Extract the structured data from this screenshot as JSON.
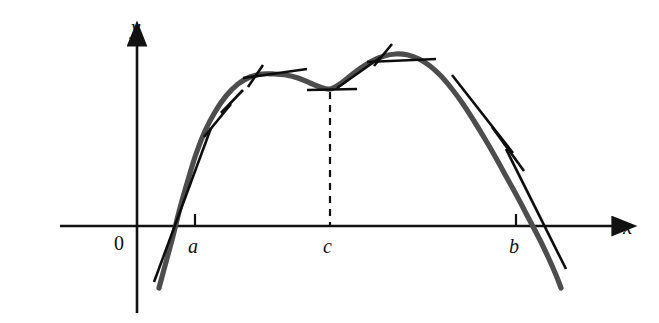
{
  "figure": {
    "background_color": "#ffffff",
    "curve_color": "#4d4d4d",
    "axis_color": "#111111",
    "tangent_color": "#0d0d0d",
    "dashed_color": "#111111"
  },
  "axes": {
    "x_axis": {
      "name": "x-axis",
      "label": "x",
      "y_pixel": 226,
      "x_start": 60,
      "x_end": 614,
      "arrow": "right"
    },
    "y_axis": {
      "name": "y-axis",
      "label": "y",
      "x_pixel": 137,
      "y_start": 44,
      "y_end": 313,
      "arrow": "up"
    },
    "origin_label": "0"
  },
  "ticks": [
    {
      "label": "a",
      "x": 195,
      "label_x": 188,
      "label_y": 236
    },
    {
      "label": "c",
      "x": 330,
      "label_x": 323,
      "label_y": 236
    },
    {
      "label": "b",
      "x": 516,
      "label_x": 509,
      "label_y": 236
    }
  ],
  "chart_data": {
    "type": "line",
    "xlabel": "x",
    "ylabel": "y",
    "grid": false,
    "legend": null,
    "annotations": [
      {
        "name": "point-a",
        "label": "a",
        "meaning": "left endpoint / left x-intercept"
      },
      {
        "name": "point-c",
        "label": "c",
        "meaning": "interior critical point, local minimum of the hump"
      },
      {
        "name": "point-b",
        "label": "b",
        "meaning": "right endpoint / right x-intercept"
      }
    ],
    "curve_points": [
      [
        159,
        288
      ],
      [
        166,
        262
      ],
      [
        173,
        236
      ],
      [
        180,
        208
      ],
      [
        188,
        180
      ],
      [
        196,
        154
      ],
      [
        205,
        131
      ],
      [
        215,
        112
      ],
      [
        226,
        96
      ],
      [
        238,
        84
      ],
      [
        250,
        77
      ],
      [
        262,
        74
      ],
      [
        274,
        74
      ],
      [
        286,
        75
      ],
      [
        298,
        78
      ],
      [
        310,
        83
      ],
      [
        320,
        87
      ],
      [
        330,
        89
      ],
      [
        340,
        84
      ],
      [
        350,
        76
      ],
      [
        361,
        68
      ],
      [
        372,
        61
      ],
      [
        384,
        56
      ],
      [
        396,
        54
      ],
      [
        408,
        55
      ],
      [
        419,
        59
      ],
      [
        430,
        66
      ],
      [
        441,
        76
      ],
      [
        452,
        89
      ],
      [
        463,
        104
      ],
      [
        474,
        121
      ],
      [
        485,
        139
      ],
      [
        496,
        158
      ],
      [
        507,
        178
      ],
      [
        518,
        198
      ],
      [
        529,
        219
      ],
      [
        540,
        240
      ],
      [
        549,
        259
      ],
      [
        556,
        275
      ],
      [
        561,
        288
      ]
    ],
    "tangent_segments": [
      {
        "name": "tangent-left-steep",
        "x1": 154,
        "y1": 282,
        "x2": 211,
        "y2": 128
      },
      {
        "name": "tangent-left-mid",
        "x1": 204,
        "y1": 137,
        "x2": 231,
        "y2": 104
      },
      {
        "name": "tangent-left-upper",
        "x1": 221,
        "y1": 113,
        "x2": 243,
        "y2": 90
      },
      {
        "name": "tangent-local-max-left",
        "x1": 243,
        "y1": 78,
        "x2": 307,
        "y2": 69
      },
      {
        "name": "tangent-cross-left",
        "x1": 248,
        "y1": 87,
        "x2": 263,
        "y2": 65
      },
      {
        "name": "tangent-min-at-c",
        "x1": 307,
        "y1": 90,
        "x2": 357,
        "y2": 89
      },
      {
        "name": "tangent-rise-to-peak",
        "x1": 337,
        "y1": 88,
        "x2": 381,
        "y2": 57
      },
      {
        "name": "tangent-peak-right",
        "x1": 367,
        "y1": 62,
        "x2": 436,
        "y2": 59
      },
      {
        "name": "tangent-cross-peak",
        "x1": 374,
        "y1": 66,
        "x2": 392,
        "y2": 44
      },
      {
        "name": "tangent-descend-upper",
        "x1": 452,
        "y1": 75,
        "x2": 513,
        "y2": 153
      },
      {
        "name": "tangent-descend-lower",
        "x1": 492,
        "y1": 127,
        "x2": 524,
        "y2": 171
      },
      {
        "name": "tangent-at-b",
        "x1": 506,
        "y1": 149,
        "x2": 566,
        "y2": 269
      }
    ],
    "dashed_line": {
      "name": "drop-line-at-c",
      "x": 330,
      "y_top": 92,
      "y_bottom": 226
    }
  }
}
